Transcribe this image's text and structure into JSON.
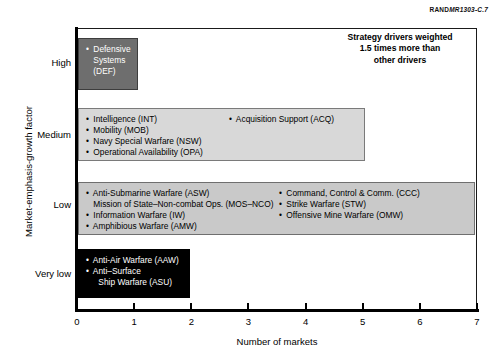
{
  "source_id": {
    "prefix": "RAND",
    "code": "MR1303-C.7"
  },
  "annotation": {
    "line1": "Strategy drivers weighted",
    "line2": "1.5 times more than",
    "line3": "other drivers"
  },
  "chart_data": {
    "type": "scatter",
    "title": "",
    "xlabel": "Number of markets",
    "ylabel": "Market-emphasis-growth factor",
    "xlim": [
      0,
      7
    ],
    "xticks": [
      "0",
      "1",
      "2",
      "3",
      "4",
      "5",
      "6",
      "7"
    ],
    "yticks": [
      "High",
      "Medium",
      "Low",
      "Very low"
    ],
    "grid": false,
    "legend": "none",
    "annotation": "Strategy drivers weighted 1.5 times more than other drivers",
    "clusters": [
      {
        "y_category": "High",
        "x_range": [
          0,
          1
        ],
        "fill": "#6e6e6e",
        "text_color": "#ffffff",
        "left_items": [
          {
            "bullet": true,
            "text": "Defensive"
          },
          {
            "bullet": false,
            "text": "Systems"
          },
          {
            "bullet": false,
            "text": "(DEF)"
          }
        ],
        "right_items": []
      },
      {
        "y_category": "Medium",
        "x_range": [
          0,
          5
        ],
        "fill": "#d8d8d8",
        "text_color": "#000000",
        "left_items": [
          {
            "bullet": true,
            "text": "Intelligence (INT)"
          },
          {
            "bullet": true,
            "text": "Mobility (MOB)"
          },
          {
            "bullet": true,
            "text": "Navy Special Warfare (NSW)"
          },
          {
            "bullet": true,
            "text": "Operational Availability (OPA)"
          }
        ],
        "right_items": [
          {
            "bullet": true,
            "text": "Acquisition Support (ACQ)"
          }
        ]
      },
      {
        "y_category": "Low",
        "x_range": [
          0,
          7
        ],
        "fill": "#c9c9c9",
        "text_color": "#000000",
        "left_items": [
          {
            "bullet": true,
            "text": "Anti-Submarine Warfare (ASW)"
          },
          {
            "bullet": false,
            "text": "Mission of State–Non-combat Ops. (MOS–NCO)"
          },
          {
            "bullet": true,
            "text": "Information Warfare (IW)"
          },
          {
            "bullet": true,
            "text": "Amphibious Warfare (AMW)"
          }
        ],
        "right_items": [
          {
            "bullet": true,
            "text": "Command, Control & Comm. (CCC)"
          },
          {
            "bullet": true,
            "text": "Strike Warfare (STW)"
          },
          {
            "bullet": true,
            "text": "Offensive Mine Warfare (OMW)"
          }
        ]
      },
      {
        "y_category": "Very low",
        "x_range": [
          0,
          2
        ],
        "fill": "#000000",
        "text_color": "#ffffff",
        "left_items": [
          {
            "bullet": true,
            "text": "Anti-Air Warfare (AAW)"
          },
          {
            "bullet": true,
            "text": "Anti–Surface"
          },
          {
            "bullet": false,
            "indent": true,
            "text": "Ship Warfare (ASU)"
          }
        ],
        "right_items": []
      }
    ]
  }
}
